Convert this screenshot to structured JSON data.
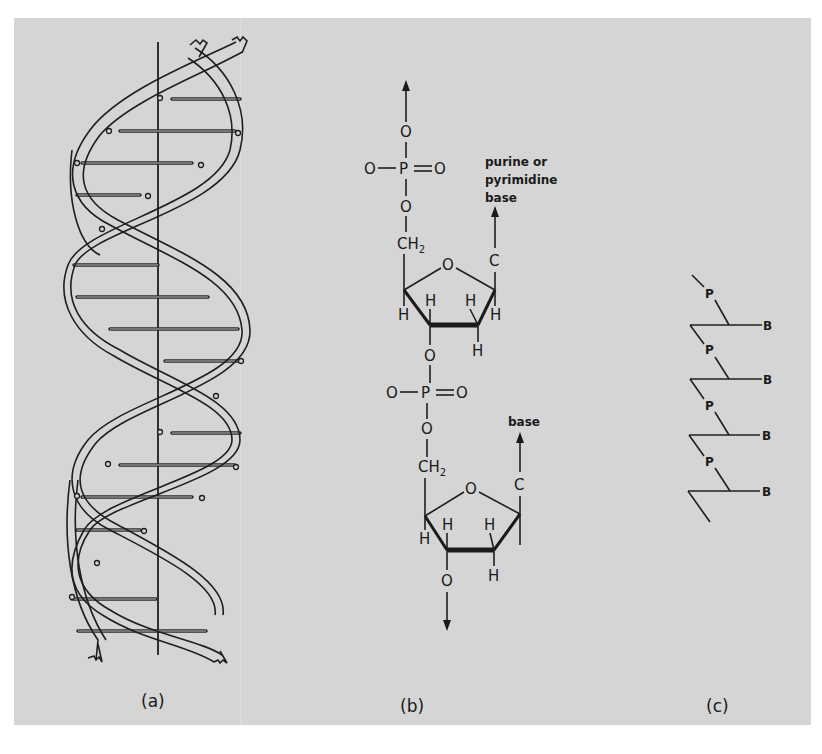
{
  "figure": {
    "background_color": "#d5d5d5",
    "ink_color": "#1a1a1a",
    "panels": [
      {
        "id": "a",
        "label": "(a)",
        "description": "Double helix ribbon model of DNA with central axis and base-pair rungs"
      },
      {
        "id": "b",
        "label": "(b)",
        "description": "Chemical structure of two nucleotide units linked by phosphodiester bonds",
        "atoms": {
          "O": "O",
          "P": "P",
          "CH": "CH",
          "sub2": "2",
          "C": "C",
          "H": "H"
        },
        "annotations": {
          "base_top_line1": "purine or",
          "base_top_line2": "pyrimidine",
          "base_top_line3": "base",
          "base_bottom": "base"
        }
      },
      {
        "id": "c",
        "label": "(c)",
        "description": "Schematic backbone with phosphate groups and bases",
        "phosphate_label": "P",
        "base_label": "B",
        "units": 4
      }
    ]
  }
}
